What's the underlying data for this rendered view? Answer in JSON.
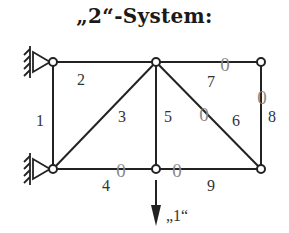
{
  "title": "„2“-System:",
  "nodes": [
    {
      "id": "A",
      "x": 53,
      "y": 62
    },
    {
      "id": "B",
      "x": 53,
      "y": 169
    },
    {
      "id": "C",
      "x": 156,
      "y": 62
    },
    {
      "id": "D",
      "x": 156,
      "y": 169
    },
    {
      "id": "E",
      "x": 261,
      "y": 62
    },
    {
      "id": "F",
      "x": 261,
      "y": 169
    }
  ],
  "members": [
    {
      "label": "1",
      "from": "A",
      "to": "B",
      "label_pos": [
        40,
        126
      ],
      "zero": false
    },
    {
      "label": "2",
      "from": "A",
      "to": "C",
      "label_pos": [
        81,
        85
      ],
      "zero": false
    },
    {
      "label": "3",
      "from": "B",
      "to": "C",
      "label_pos": [
        122,
        122
      ],
      "zero": false
    },
    {
      "label": "4",
      "from": "B",
      "to": "D",
      "label_pos": [
        106,
        191
      ],
      "zero": true,
      "zero_pos": [
        121,
        177
      ]
    },
    {
      "label": "5",
      "from": "C",
      "to": "D",
      "label_pos": [
        168,
        122
      ],
      "zero": false
    },
    {
      "label": "6",
      "from": "C",
      "to": "F",
      "label_pos": [
        236,
        126
      ],
      "zero": true,
      "zero_pos": [
        204,
        121
      ]
    },
    {
      "label": "7",
      "from": "C",
      "to": "E",
      "label_pos": [
        211,
        87
      ],
      "zero": true,
      "zero_pos": [
        225,
        71
      ]
    },
    {
      "label": "8",
      "from": "E",
      "to": "F",
      "label_pos": [
        272,
        122
      ],
      "zero": true,
      "zero_pos": [
        262,
        104
      ]
    },
    {
      "label": "9",
      "from": "D",
      "to": "F",
      "label_pos": [
        211,
        191
      ],
      "zero": true,
      "zero_pos": [
        177,
        177
      ]
    }
  ],
  "zero_symbol": "0",
  "load": {
    "label": "„1“",
    "node": "D",
    "direction": "down"
  },
  "supports": [
    {
      "node": "A",
      "type": "pinned"
    },
    {
      "node": "B",
      "type": "pinned"
    }
  ]
}
